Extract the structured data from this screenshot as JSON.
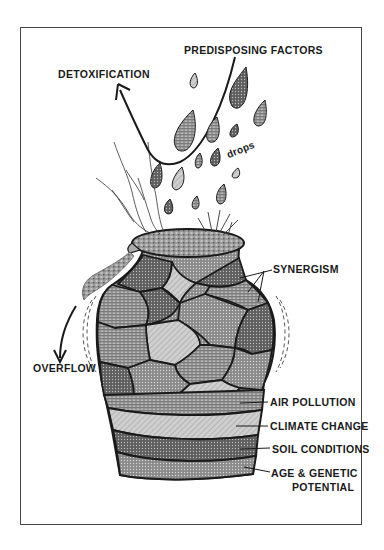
{
  "labels": {
    "predisposing": "PREDISPOSING FACTORS",
    "detoxification": "DETOXIFICATION",
    "drops": "drops",
    "synergism": "SYNERGISM",
    "overflow": "OVERFLOW",
    "air_pollution": "AIR POLLUTION",
    "climate_change": "CLIMATE CHANGE",
    "soil_conditions": "SOIL CONDITIONS",
    "age_genetic_1": "AGE & GENETIC",
    "age_genetic_2": "POTENTIAL"
  },
  "colors": {
    "ink": "#1a1a1a",
    "dark_fill": "#6e6e6e",
    "mid_fill": "#8c8c8c",
    "light_fill": "#c4c4c4",
    "frame": "#444444"
  }
}
